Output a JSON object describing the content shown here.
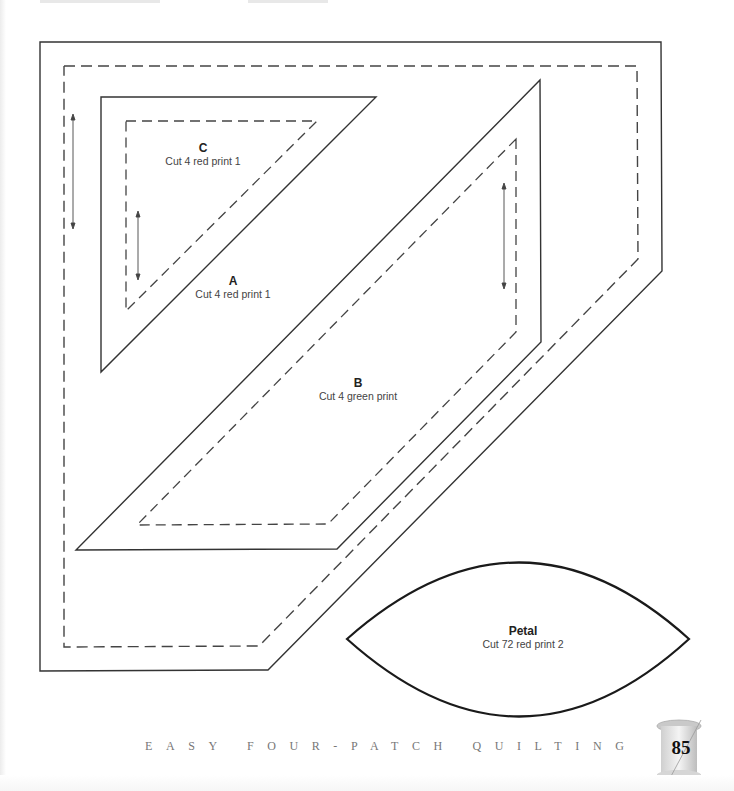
{
  "pieces": {
    "A": {
      "name": "A",
      "instruction": "Cut 4 red print 1"
    },
    "B": {
      "name": "B",
      "instruction": "Cut 4 green print"
    },
    "C": {
      "name": "C",
      "instruction": "Cut 4 red print 1"
    },
    "petal": {
      "name": "Petal",
      "instruction": "Cut 72 red print 2"
    }
  },
  "footer": {
    "book_title": "EASY FOUR-PATCH QUILTING",
    "page_number": "85"
  },
  "colors": {
    "line": "#333333",
    "dashed": "#444444",
    "footer_text": "#777777"
  }
}
